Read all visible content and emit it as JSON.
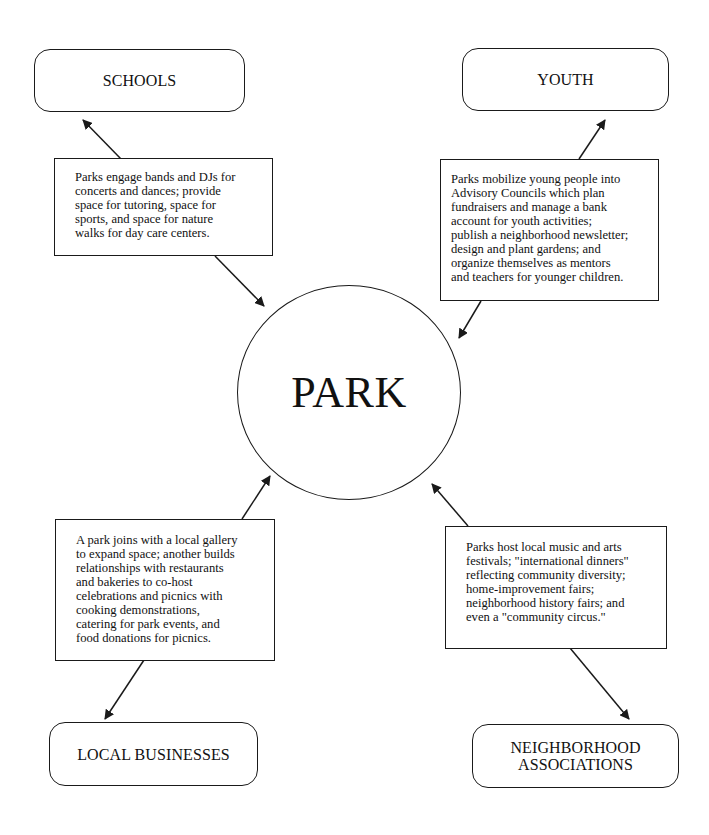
{
  "hub": {
    "label": "PARK"
  },
  "nodes": {
    "schools": {
      "label": "SCHOOLS"
    },
    "youth": {
      "label": "YOUTH"
    },
    "local_businesses": {
      "label": "LOCAL BUSINESSES"
    },
    "neighborhood_associations": {
      "line1": "NEIGHBORHOOD",
      "line2": "ASSOCIATIONS"
    }
  },
  "descriptions": {
    "schools": {
      "lines": [
        "Parks engage bands and DJs for",
        "concerts and dances; provide",
        "space for tutoring, space for",
        "sports, and space for nature",
        "walks for day care centers."
      ]
    },
    "youth": {
      "lines": [
        "Parks mobilize young people into",
        "Advisory Councils which plan",
        "fundraisers and manage a bank",
        "account for youth activities;",
        "publish a neighborhood newsletter;",
        "design and plant gardens; and",
        "organize themselves as mentors",
        "and teachers for younger children."
      ]
    },
    "local_businesses": {
      "lines": [
        "A park joins with a local gallery",
        "to expand space; another builds",
        "relationships with restaurants",
        "and bakeries to co-host",
        "celebrations and picnics with",
        "cooking demonstrations,",
        "catering for park events, and",
        "food donations for picnics."
      ]
    },
    "neighborhood_associations": {
      "lines": [
        "Parks host local music and arts",
        "festivals; \"international dinners\"",
        "reflecting community diversity;",
        "home-improvement fairs;",
        "neighborhood history fairs; and",
        "even a \"community circus.\""
      ]
    }
  },
  "colors": {
    "stroke": "#1a1a1a",
    "background": "#ffffff",
    "text": "#111111"
  }
}
